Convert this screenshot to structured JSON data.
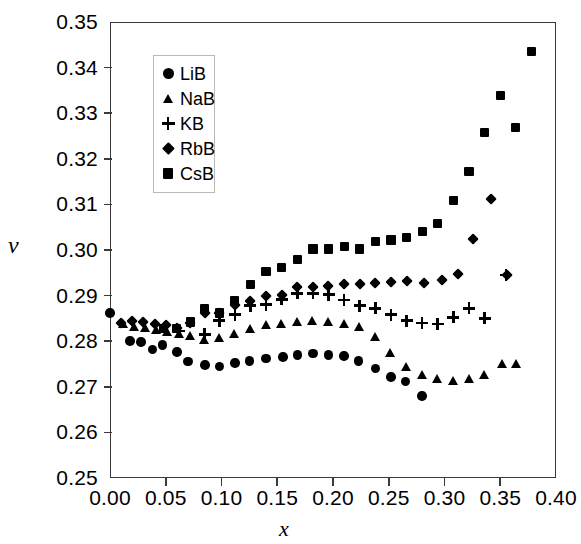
{
  "chart_data": {
    "type": "scatter",
    "title": "",
    "xlabel": "x",
    "ylabel": "ν",
    "xlim": [
      0.0,
      0.4
    ],
    "ylim": [
      0.25,
      0.35
    ],
    "xticks": [
      "0.00",
      "0.05",
      "0.10",
      "0.15",
      "0.20",
      "0.25",
      "0.30",
      "0.35",
      "0.40"
    ],
    "xtick_values": [
      0.0,
      0.05,
      0.1,
      0.15,
      0.2,
      0.25,
      0.3,
      0.35,
      0.4
    ],
    "yticks": [
      "0.25",
      "0.26",
      "0.27",
      "0.28",
      "0.29",
      "0.30",
      "0.31",
      "0.32",
      "0.33",
      "0.34",
      "0.35"
    ],
    "ytick_values": [
      0.25,
      0.26,
      0.27,
      0.28,
      0.29,
      0.3,
      0.31,
      0.32,
      0.33,
      0.34,
      0.35
    ],
    "grid": false,
    "legend_position": "upper-left-inside",
    "marker_color": "#000000",
    "series": [
      {
        "name": "LiB",
        "marker": "circle",
        "x": [
          0.0,
          0.018,
          0.028,
          0.038,
          0.047,
          0.06,
          0.07,
          0.085,
          0.098,
          0.112,
          0.125,
          0.14,
          0.155,
          0.168,
          0.182,
          0.196,
          0.21,
          0.223,
          0.238,
          0.252,
          0.265,
          0.28
        ],
        "y": [
          0.2862,
          0.28,
          0.2798,
          0.2782,
          0.2792,
          0.2776,
          0.2755,
          0.2748,
          0.2745,
          0.2752,
          0.2757,
          0.2762,
          0.2765,
          0.277,
          0.2773,
          0.277,
          0.2768,
          0.2757,
          0.274,
          0.2722,
          0.2712,
          0.268
        ]
      },
      {
        "name": "NaB",
        "marker": "triangle",
        "x": [
          0.012,
          0.022,
          0.032,
          0.042,
          0.052,
          0.062,
          0.072,
          0.085,
          0.098,
          0.112,
          0.126,
          0.14,
          0.154,
          0.168,
          0.182,
          0.196,
          0.21,
          0.224,
          0.238,
          0.252,
          0.266,
          0.28,
          0.294,
          0.308,
          0.322,
          0.336,
          0.352,
          0.365
        ],
        "y": [
          0.2838,
          0.2832,
          0.283,
          0.2825,
          0.2822,
          0.2818,
          0.2812,
          0.2803,
          0.2808,
          0.2818,
          0.2828,
          0.2836,
          0.284,
          0.2843,
          0.2845,
          0.2843,
          0.284,
          0.2832,
          0.281,
          0.2775,
          0.2745,
          0.2728,
          0.2718,
          0.2715,
          0.2718,
          0.2728,
          0.2752,
          0.2752
        ]
      },
      {
        "name": "KB",
        "marker": "plus",
        "x": [
          0.062,
          0.085,
          0.098,
          0.112,
          0.126,
          0.14,
          0.154,
          0.168,
          0.182,
          0.196,
          0.21,
          0.224,
          0.238,
          0.252,
          0.266,
          0.28,
          0.294,
          0.308,
          0.322,
          0.336,
          0.355
        ],
        "y": [
          0.2822,
          0.2815,
          0.2845,
          0.2858,
          0.2878,
          0.288,
          0.2892,
          0.2905,
          0.2905,
          0.2902,
          0.289,
          0.2878,
          0.2872,
          0.2858,
          0.2845,
          0.284,
          0.2838,
          0.2852,
          0.2872,
          0.285,
          0.2945
        ]
      },
      {
        "name": "RbB",
        "marker": "diamond",
        "x": [
          0.01,
          0.02,
          0.03,
          0.04,
          0.05,
          0.06,
          0.072,
          0.085,
          0.098,
          0.112,
          0.126,
          0.14,
          0.154,
          0.168,
          0.182,
          0.196,
          0.21,
          0.224,
          0.238,
          0.252,
          0.266,
          0.282,
          0.298,
          0.312,
          0.326,
          0.342,
          0.356
        ],
        "y": [
          0.284,
          0.2845,
          0.2842,
          0.2838,
          0.2835,
          0.2828,
          0.284,
          0.2862,
          0.2862,
          0.288,
          0.2888,
          0.2898,
          0.2902,
          0.2918,
          0.2918,
          0.292,
          0.2925,
          0.2925,
          0.2928,
          0.293,
          0.2932,
          0.2928,
          0.2935,
          0.2948,
          0.3025,
          0.3112,
          0.2945
        ]
      },
      {
        "name": "CsB",
        "marker": "square",
        "x": [
          0.048,
          0.06,
          0.072,
          0.085,
          0.098,
          0.112,
          0.126,
          0.14,
          0.154,
          0.168,
          0.182,
          0.196,
          0.21,
          0.224,
          0.238,
          0.252,
          0.266,
          0.28,
          0.294,
          0.308,
          0.322,
          0.336,
          0.35,
          0.364,
          0.378
        ],
        "y": [
          0.2828,
          0.2828,
          0.2842,
          0.2872,
          0.2862,
          0.2888,
          0.2925,
          0.2952,
          0.2962,
          0.298,
          0.3002,
          0.3002,
          0.3008,
          0.3002,
          0.3018,
          0.3022,
          0.3028,
          0.304,
          0.3058,
          0.3108,
          0.3172,
          0.3258,
          0.3338,
          0.3268,
          0.3435
        ]
      }
    ]
  },
  "legend": {
    "items": [
      {
        "label": "LiB",
        "marker": "circle"
      },
      {
        "label": "NaB",
        "marker": "triangle"
      },
      {
        "label": "KB",
        "marker": "plus"
      },
      {
        "label": "RbB",
        "marker": "diamond"
      },
      {
        "label": "CsB",
        "marker": "square"
      }
    ]
  }
}
